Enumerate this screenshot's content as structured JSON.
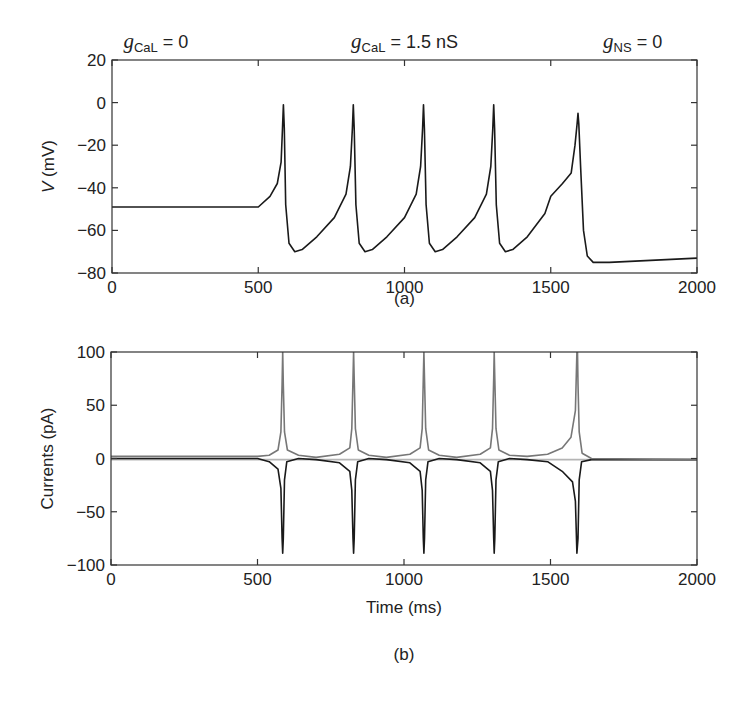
{
  "chart_data": [
    {
      "panel": "a",
      "type": "line",
      "caption": "(a)",
      "xlabel": "",
      "ylabel_var": "V",
      "ylabel_unit": " (mV)",
      "xlim": [
        0,
        2000
      ],
      "ylim": [
        -80,
        20
      ],
      "xticks": [
        0,
        500,
        1000,
        1500,
        2000
      ],
      "yticks": [
        20,
        0,
        -20,
        -40,
        -60,
        -80
      ],
      "grid": false,
      "annotations": [
        {
          "var": "g",
          "sub": "CaL",
          "text": " = 0",
          "x_ms": 150
        },
        {
          "var": "g",
          "sub": "CaL",
          "text": " = 1.5 nS",
          "x_ms": 1000
        },
        {
          "var": "g",
          "sub": "NS",
          "text": " = 0",
          "x_ms": 1780
        }
      ],
      "series": [
        {
          "name": "V",
          "color": "#1a1a1a",
          "x": [
            0,
            500,
            540,
            565,
            578,
            583,
            586,
            589,
            594,
            605,
            625,
            650,
            700,
            760,
            800,
            815,
            822,
            825,
            828,
            834,
            845,
            865,
            890,
            940,
            1000,
            1040,
            1055,
            1062,
            1065,
            1068,
            1074,
            1085,
            1105,
            1130,
            1180,
            1240,
            1280,
            1295,
            1302,
            1305,
            1308,
            1314,
            1325,
            1345,
            1370,
            1420,
            1480,
            1500,
            1540,
            1570,
            1583,
            1590,
            1593,
            1596,
            1602,
            1612,
            1625,
            1645,
            1700,
            2000
          ],
          "y": [
            -49,
            -49,
            -44,
            -38,
            -28,
            -12,
            -1,
            -12,
            -48,
            -66,
            -70,
            -69,
            -63,
            -54,
            -43,
            -30,
            -12,
            -1,
            -12,
            -48,
            -66,
            -70,
            -69,
            -63,
            -54,
            -43,
            -30,
            -12,
            -1,
            -12,
            -48,
            -66,
            -70,
            -69,
            -63,
            -54,
            -43,
            -30,
            -12,
            -1,
            -12,
            -48,
            -66,
            -70,
            -69,
            -63,
            -52,
            -44,
            -38,
            -33,
            -20,
            -10,
            -5,
            -10,
            -30,
            -60,
            -72,
            -75,
            -75,
            -73
          ]
        }
      ]
    },
    {
      "panel": "b",
      "type": "line",
      "caption": "(b)",
      "xlabel": "Time (ms)",
      "ylabel": "Currents (pA)",
      "xlim": [
        0,
        2000
      ],
      "ylim": [
        -100,
        100
      ],
      "xticks": [
        0,
        500,
        1000,
        1500,
        2000
      ],
      "yticks": [
        100,
        50,
        0,
        -50,
        -100
      ],
      "grid": false,
      "series": [
        {
          "name": "outward current (gray)",
          "color": "#777777",
          "x": [
            0,
            500,
            540,
            570,
            580,
            584,
            586,
            588,
            592,
            602,
            640,
            700,
            780,
            815,
            822,
            826,
            828,
            830,
            834,
            844,
            880,
            940,
            1020,
            1055,
            1062,
            1066,
            1068,
            1070,
            1074,
            1084,
            1120,
            1180,
            1260,
            1295,
            1302,
            1306,
            1308,
            1310,
            1314,
            1324,
            1360,
            1420,
            1490,
            1540,
            1570,
            1585,
            1590,
            1592,
            1594,
            1598,
            1608,
            1640,
            2000
          ],
          "y": [
            2,
            2,
            3,
            8,
            25,
            70,
            100,
            70,
            25,
            8,
            3,
            1,
            4,
            10,
            28,
            75,
            100,
            75,
            28,
            8,
            3,
            1,
            4,
            10,
            28,
            75,
            100,
            75,
            28,
            8,
            3,
            1,
            4,
            10,
            28,
            75,
            100,
            75,
            28,
            8,
            3,
            2,
            4,
            10,
            20,
            45,
            100,
            100,
            70,
            25,
            5,
            0,
            -1
          ]
        },
        {
          "name": "inward current (black)",
          "color": "#1a1a1a",
          "x": [
            0,
            500,
            540,
            570,
            580,
            584,
            586,
            588,
            592,
            600,
            640,
            700,
            780,
            815,
            822,
            826,
            828,
            830,
            834,
            842,
            880,
            940,
            1020,
            1055,
            1062,
            1066,
            1068,
            1070,
            1074,
            1082,
            1120,
            1180,
            1260,
            1295,
            1302,
            1306,
            1308,
            1310,
            1314,
            1322,
            1360,
            1420,
            1490,
            1540,
            1575,
            1585,
            1590,
            1594,
            1598,
            1606,
            1640,
            2000
          ],
          "y": [
            0,
            0,
            -3,
            -10,
            -28,
            -75,
            -89,
            -75,
            -20,
            -3,
            0,
            -1,
            -4,
            -12,
            -30,
            -75,
            -89,
            -75,
            -20,
            -3,
            0,
            -1,
            -4,
            -12,
            -30,
            -75,
            -89,
            -75,
            -20,
            -3,
            0,
            -1,
            -4,
            -12,
            -30,
            -75,
            -89,
            -75,
            -20,
            -3,
            0,
            -1,
            -3,
            -12,
            -22,
            -40,
            -89,
            -75,
            -20,
            -3,
            -1,
            -1
          ]
        },
        {
          "name": "small current (light gray)",
          "color": "#b5b5b5",
          "x": [
            0,
            2000
          ],
          "y": [
            -1,
            -1
          ]
        }
      ]
    }
  ]
}
